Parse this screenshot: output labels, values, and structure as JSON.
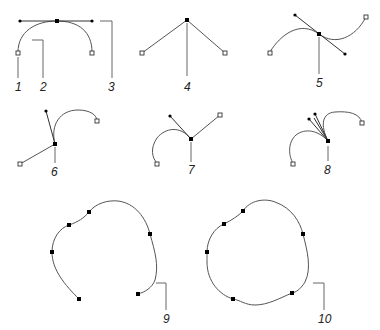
{
  "diagram": {
    "colors": {
      "line": "#555555",
      "anchor": "#000000",
      "background": "#ffffff"
    },
    "labels": {
      "l1": "1",
      "l2": "2",
      "l3": "3",
      "l4": "4",
      "l5": "5",
      "l6": "6",
      "l7": "7",
      "l8": "8",
      "l9": "9",
      "l10": "10"
    },
    "figures": [
      {
        "id": "smooth-point",
        "callouts": [
          "1",
          "2",
          "3"
        ],
        "parts": [
          "end point",
          "curve segment",
          "direction line"
        ]
      },
      {
        "id": "corner-point",
        "callouts": [
          "4"
        ]
      },
      {
        "id": "smooth-s-curve",
        "callouts": [
          "5"
        ]
      },
      {
        "id": "curve-to-straight-corner",
        "callouts": [
          "6"
        ]
      },
      {
        "id": "straight-to-curve-corner",
        "callouts": [
          "7"
        ]
      },
      {
        "id": "two-curve-corner",
        "callouts": [
          "8"
        ]
      },
      {
        "id": "open-path",
        "callouts": [
          "9"
        ]
      },
      {
        "id": "closed-path",
        "callouts": [
          "10"
        ]
      }
    ]
  }
}
